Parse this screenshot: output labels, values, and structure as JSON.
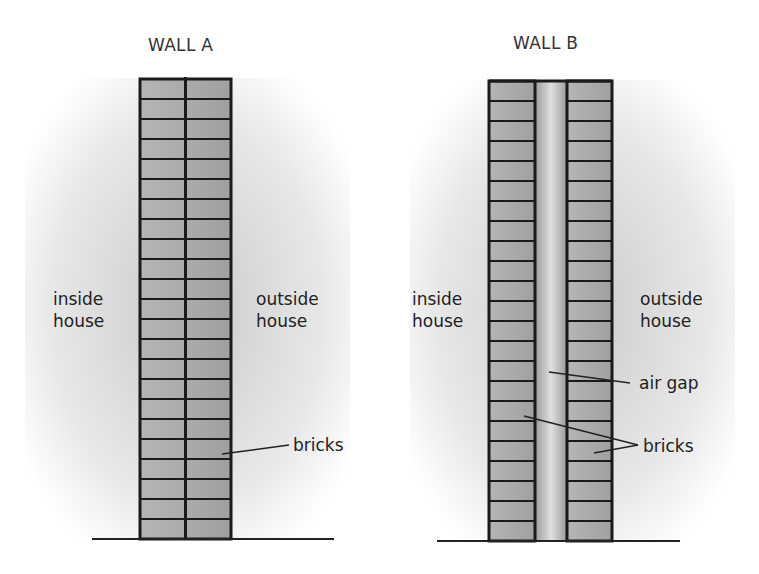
{
  "walls": [
    {
      "title": "WALL A",
      "inside_label": [
        "inside",
        "house"
      ],
      "outside_label": [
        "outside",
        "house"
      ],
      "callouts": [
        "bricks"
      ]
    },
    {
      "title": "WALL B",
      "inside_label": [
        "inside",
        "house"
      ],
      "outside_label": [
        "outside",
        "house"
      ],
      "callouts": [
        "air gap",
        "bricks"
      ]
    }
  ],
  "colors": {
    "brick": "#a9a9a9",
    "mortar": "#1a1a1a",
    "gap": "#c8c8c8"
  }
}
